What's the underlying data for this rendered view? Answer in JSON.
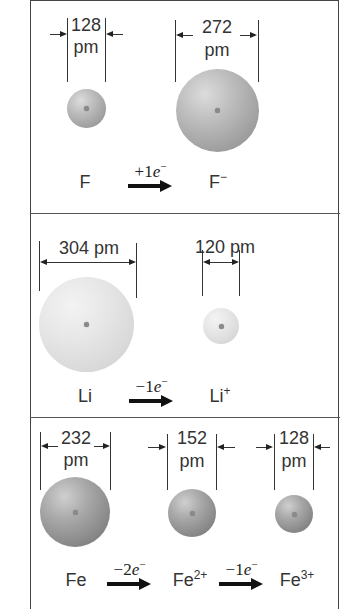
{
  "panels": [
    {
      "id": "fluorine",
      "species": [
        {
          "symbol": "F",
          "charge": "",
          "size_label_num": "128",
          "size_label_unit": "pm",
          "diameter_pm": 128
        },
        {
          "symbol": "F",
          "charge": "−",
          "size_label_num": "272",
          "size_label_unit": "pm",
          "diameter_pm": 272
        }
      ],
      "reactions": [
        {
          "sign": "+1",
          "e": "e",
          "charge": "−"
        }
      ]
    },
    {
      "id": "lithium",
      "species": [
        {
          "symbol": "Li",
          "charge": "",
          "size_label": "304 pm",
          "diameter_pm": 304
        },
        {
          "symbol": "Li",
          "charge": "+",
          "size_label": "120 pm",
          "diameter_pm": 120
        }
      ],
      "reactions": [
        {
          "sign": "−1",
          "e": "e",
          "charge": "−"
        }
      ]
    },
    {
      "id": "iron",
      "species": [
        {
          "symbol": "Fe",
          "charge": "",
          "size_label_num": "232",
          "size_label_unit": "pm",
          "diameter_pm": 232
        },
        {
          "symbol": "Fe",
          "charge": "2+",
          "size_label_num": "152",
          "size_label_unit": "pm",
          "diameter_pm": 152
        },
        {
          "symbol": "Fe",
          "charge": "3+",
          "size_label_num": "128",
          "size_label_unit": "pm",
          "diameter_pm": 128
        }
      ],
      "reactions": [
        {
          "sign": "−2",
          "e": "e",
          "charge": "−"
        },
        {
          "sign": "−1",
          "e": "e",
          "charge": "−"
        }
      ]
    }
  ],
  "colors": {
    "border": "#444444",
    "sphere_mid": "#a8a8a8",
    "sphere_light": "#dedede",
    "sphere_dark": "#8a8a8a",
    "arrow": "#111111"
  }
}
